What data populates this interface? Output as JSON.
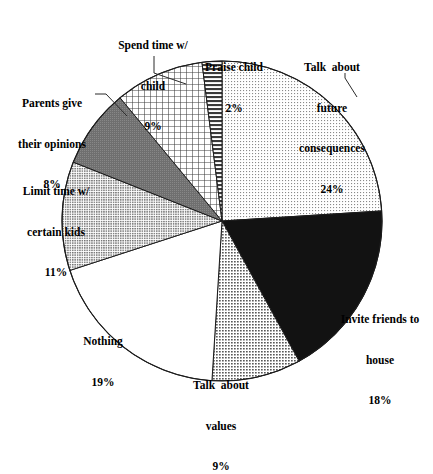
{
  "chart_data": {
    "type": "pie",
    "title": "",
    "subtitle": "",
    "xlabel": "",
    "ylabel": "",
    "legend_position": "none",
    "grid": false,
    "units": "percent",
    "start_angle_deg": 0,
    "direction": "clockwise",
    "categories": [
      "Talk  about future consequences",
      "Invite friends to house",
      "Talk  about values",
      "Nothing",
      "Limit time w/ certain kids",
      "Parents give their opinions",
      "Spend time w/ child",
      "Praise child"
    ],
    "values": [
      24,
      18,
      9,
      19,
      11,
      8,
      9,
      2
    ],
    "slices": [
      {
        "id": "future-consequences",
        "label_lines": [
          "Talk  about",
          "future",
          "consequences"
        ],
        "percent_text": "24%",
        "value": 24,
        "fill_pattern": "fine-dots",
        "fill_color": "#e8e8e8",
        "has_leader": true
      },
      {
        "id": "invite-friends",
        "label_lines": [
          "Invite friends to",
          "house"
        ],
        "percent_text": "18%",
        "value": 18,
        "fill_pattern": "solid-black",
        "fill_color": "#111111",
        "has_leader": false
      },
      {
        "id": "talk-values",
        "label_lines": [
          "Talk  about",
          "values"
        ],
        "percent_text": "9%",
        "value": 9,
        "fill_pattern": "medium-dots",
        "fill_color": "#b9b9b9",
        "has_leader": false
      },
      {
        "id": "nothing",
        "label_lines": [
          "Nothing"
        ],
        "percent_text": "19%",
        "value": 19,
        "fill_pattern": "white",
        "fill_color": "#ffffff",
        "has_leader": false
      },
      {
        "id": "limit-time",
        "label_lines": [
          "Limit time w/",
          "certain kids"
        ],
        "percent_text": "11%",
        "value": 11,
        "fill_pattern": "light-dots",
        "fill_color": "#bdbdbd",
        "has_leader": false
      },
      {
        "id": "parents-opinions",
        "label_lines": [
          "Parents give",
          "their opinions"
        ],
        "percent_text": "8%",
        "value": 8,
        "fill_pattern": "dark-gray",
        "fill_color": "#7d7d7d",
        "has_leader": true
      },
      {
        "id": "spend-time",
        "label_lines": [
          "Spend time w/",
          "child"
        ],
        "percent_text": "9%",
        "value": 9,
        "fill_pattern": "cross-hatch-grid",
        "fill_color": "#d9d9d9",
        "has_leader": true
      },
      {
        "id": "praise-child",
        "label_lines": [
          "Praise child"
        ],
        "percent_text": "2%",
        "value": 2,
        "fill_pattern": "horizontal-stripes",
        "fill_color": "#909090",
        "has_leader": false
      }
    ],
    "total": 100,
    "geometry": {
      "center_x": 222,
      "center_y": 221,
      "radius": 160
    }
  }
}
